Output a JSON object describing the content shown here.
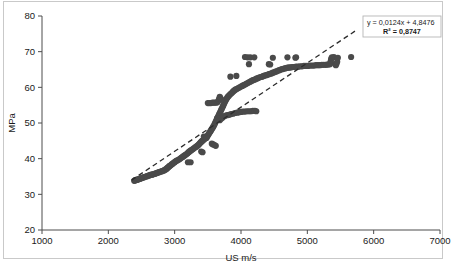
{
  "figure": {
    "background": "#ffffff",
    "border_color": "#c9c9c9"
  },
  "chart_data": {
    "type": "scatter",
    "title": "",
    "xlabel": "US m/s",
    "ylabel": "MPa",
    "xlim": [
      1000,
      7000
    ],
    "ylim": [
      20,
      80
    ],
    "xticks": [
      1000,
      2000,
      3000,
      4000,
      5000,
      6000,
      7000
    ],
    "yticks": [
      20,
      30,
      40,
      50,
      60,
      70,
      80
    ],
    "xtick_labels": [
      "1000",
      "2000",
      "3000",
      "4000",
      "5000",
      "6000",
      "7000"
    ],
    "ytick_labels": [
      "20",
      "30",
      "40",
      "50",
      "60",
      "70",
      "80"
    ],
    "grid": false,
    "legend": false,
    "marker_color": "#4a4a4a",
    "marker_size": 3.1,
    "trendline": {
      "type": "linear",
      "style": "dashed",
      "color": "#2b2b2b",
      "slope": 0.0124,
      "intercept": 4.8476,
      "equation_label": "y = 0,0124x + 4,8476",
      "r2_label": "R² = 0,8747",
      "r2_value": 0.8747,
      "x_start": 2350,
      "x_end": 5750
    },
    "points": [
      [
        2390,
        33.8
      ],
      [
        2400,
        33.9
      ],
      [
        2410,
        34.0
      ],
      [
        2420,
        34.0
      ],
      [
        2430,
        34.1
      ],
      [
        2440,
        34.1
      ],
      [
        2455,
        34.2
      ],
      [
        2465,
        34.3
      ],
      [
        2480,
        34.4
      ],
      [
        2495,
        34.5
      ],
      [
        2510,
        34.6
      ],
      [
        2525,
        34.7
      ],
      [
        2540,
        34.8
      ],
      [
        2555,
        34.9
      ],
      [
        2570,
        35.0
      ],
      [
        2585,
        35.1
      ],
      [
        2600,
        35.2
      ],
      [
        2615,
        35.3
      ],
      [
        2630,
        35.4
      ],
      [
        2645,
        35.5
      ],
      [
        2660,
        35.5
      ],
      [
        2675,
        35.6
      ],
      [
        2690,
        35.7
      ],
      [
        2705,
        35.8
      ],
      [
        2720,
        35.9
      ],
      [
        2735,
        36.0
      ],
      [
        2750,
        36.1
      ],
      [
        2765,
        36.2
      ],
      [
        2780,
        36.3
      ],
      [
        2795,
        36.4
      ],
      [
        2810,
        36.5
      ],
      [
        2825,
        36.6
      ],
      [
        2840,
        36.7
      ],
      [
        2855,
        36.9
      ],
      [
        2870,
        37.0
      ],
      [
        2880,
        37.2
      ],
      [
        2890,
        37.4
      ],
      [
        2900,
        37.5
      ],
      [
        2910,
        37.7
      ],
      [
        2920,
        37.9
      ],
      [
        2930,
        38.0
      ],
      [
        2945,
        38.2
      ],
      [
        2955,
        38.4
      ],
      [
        2965,
        38.5
      ],
      [
        2975,
        38.7
      ],
      [
        2990,
        38.9
      ],
      [
        3000,
        39.0
      ],
      [
        3010,
        39.2
      ],
      [
        3025,
        39.4
      ],
      [
        3040,
        39.5
      ],
      [
        3060,
        39.7
      ],
      [
        3075,
        39.9
      ],
      [
        3090,
        40.1
      ],
      [
        3105,
        40.3
      ],
      [
        3120,
        40.5
      ],
      [
        3135,
        40.7
      ],
      [
        3150,
        40.9
      ],
      [
        3165,
        41.1
      ],
      [
        3180,
        41.3
      ],
      [
        3195,
        41.5
      ],
      [
        3205,
        41.7
      ],
      [
        3215,
        41.9
      ],
      [
        3230,
        42.1
      ],
      [
        3245,
        42.3
      ],
      [
        3260,
        42.5
      ],
      [
        3275,
        42.7
      ],
      [
        3290,
        42.9
      ],
      [
        3305,
        43.1
      ],
      [
        3320,
        43.3
      ],
      [
        3335,
        43.5
      ],
      [
        3350,
        43.7
      ],
      [
        3360,
        43.9
      ],
      [
        3370,
        44.1
      ],
      [
        3380,
        44.3
      ],
      [
        3390,
        44.5
      ],
      [
        3400,
        44.7
      ],
      [
        3410,
        44.9
      ],
      [
        3420,
        45.0
      ],
      [
        3430,
        45.2
      ],
      [
        3440,
        45.4
      ],
      [
        3450,
        45.5
      ],
      [
        3460,
        45.7
      ],
      [
        3470,
        45.9
      ],
      [
        3480,
        46.1
      ],
      [
        3490,
        46.3
      ],
      [
        3500,
        46.5
      ],
      [
        3510,
        46.8
      ],
      [
        3520,
        47.1
      ],
      [
        3530,
        47.4
      ],
      [
        3540,
        47.7
      ],
      [
        3550,
        48.0
      ],
      [
        3560,
        48.3
      ],
      [
        3570,
        48.6
      ],
      [
        3580,
        48.9
      ],
      [
        3590,
        49.2
      ],
      [
        3600,
        49.6
      ],
      [
        3610,
        50.0
      ],
      [
        3620,
        50.4
      ],
      [
        3630,
        50.8
      ],
      [
        3640,
        51.2
      ],
      [
        3650,
        51.6
      ],
      [
        3660,
        52.0
      ],
      [
        3670,
        52.4
      ],
      [
        3680,
        52.8
      ],
      [
        3690,
        53.2
      ],
      [
        3700,
        53.6
      ],
      [
        3710,
        54.0
      ],
      [
        3720,
        54.4
      ],
      [
        3730,
        54.8
      ],
      [
        3740,
        55.2
      ],
      [
        3750,
        55.6
      ],
      [
        3760,
        56.0
      ],
      [
        3770,
        56.4
      ],
      [
        3780,
        56.7
      ],
      [
        3790,
        57.0
      ],
      [
        3800,
        57.3
      ],
      [
        3815,
        57.6
      ],
      [
        3830,
        57.9
      ],
      [
        3845,
        58.2
      ],
      [
        3860,
        58.4
      ],
      [
        3875,
        58.7
      ],
      [
        3890,
        59.0
      ],
      [
        3905,
        59.2
      ],
      [
        3920,
        59.4
      ],
      [
        3940,
        59.6
      ],
      [
        3960,
        59.8
      ],
      [
        3980,
        60.0
      ],
      [
        4000,
        60.2
      ],
      [
        4020,
        60.4
      ],
      [
        4040,
        60.6
      ],
      [
        4060,
        60.8
      ],
      [
        4080,
        61.0
      ],
      [
        4100,
        61.2
      ],
      [
        4120,
        61.4
      ],
      [
        4140,
        61.6
      ],
      [
        4160,
        61.8
      ],
      [
        4180,
        62.0
      ],
      [
        4200,
        62.1
      ],
      [
        4220,
        62.3
      ],
      [
        4240,
        62.5
      ],
      [
        4260,
        62.6
      ],
      [
        4280,
        62.8
      ],
      [
        4300,
        62.9
      ],
      [
        4320,
        63.0
      ],
      [
        4340,
        63.2
      ],
      [
        4360,
        63.3
      ],
      [
        4380,
        63.4
      ],
      [
        4400,
        63.5
      ],
      [
        4420,
        63.7
      ],
      [
        4440,
        63.8
      ],
      [
        4460,
        63.9
      ],
      [
        4480,
        64.1
      ],
      [
        4500,
        64.2
      ],
      [
        4520,
        64.4
      ],
      [
        4540,
        64.5
      ],
      [
        4560,
        64.7
      ],
      [
        4580,
        64.8
      ],
      [
        4600,
        65.0
      ],
      [
        4620,
        65.1
      ],
      [
        4640,
        65.2
      ],
      [
        4660,
        65.3
      ],
      [
        4680,
        65.4
      ],
      [
        4700,
        65.5
      ],
      [
        4720,
        65.5
      ],
      [
        4740,
        65.6
      ],
      [
        4760,
        65.6
      ],
      [
        4780,
        65.7
      ],
      [
        4800,
        65.7
      ],
      [
        4830,
        65.8
      ],
      [
        4860,
        65.8
      ],
      [
        4890,
        65.9
      ],
      [
        4920,
        65.9
      ],
      [
        4950,
        66.0
      ],
      [
        4980,
        66.0
      ],
      [
        5010,
        66.0
      ],
      [
        5040,
        66.1
      ],
      [
        5070,
        66.1
      ],
      [
        5100,
        66.1
      ],
      [
        5130,
        66.2
      ],
      [
        5160,
        66.2
      ],
      [
        5190,
        66.2
      ],
      [
        5220,
        66.3
      ],
      [
        5250,
        66.3
      ],
      [
        5280,
        66.3
      ],
      [
        5300,
        66.4
      ],
      [
        5320,
        66.4
      ],
      [
        5340,
        66.5
      ],
      [
        5350,
        67.0
      ],
      [
        5355,
        67.5
      ],
      [
        5360,
        68.0
      ],
      [
        5370,
        68.4
      ],
      [
        5400,
        68.5
      ],
      [
        5420,
        66.5
      ],
      [
        5430,
        66.2
      ],
      [
        5440,
        66.6
      ],
      [
        5450,
        67.2
      ],
      [
        5460,
        68.3
      ],
      [
        5660,
        68.5
      ],
      [
        3500,
        55.6
      ],
      [
        3520,
        55.6
      ],
      [
        3545,
        55.6
      ],
      [
        3570,
        55.7
      ],
      [
        3595,
        55.7
      ],
      [
        3620,
        55.7
      ],
      [
        3645,
        55.8
      ],
      [
        3660,
        56.3
      ],
      [
        3670,
        56.8
      ],
      [
        3680,
        57.3
      ],
      [
        3690,
        57.0
      ],
      [
        3700,
        56.6
      ],
      [
        3640,
        51.3
      ],
      [
        3660,
        51.0
      ],
      [
        3680,
        50.8
      ],
      [
        3700,
        51.2
      ],
      [
        3720,
        51.5
      ],
      [
        3740,
        51.8
      ],
      [
        3760,
        52.0
      ],
      [
        3790,
        52.2
      ],
      [
        3820,
        52.3
      ],
      [
        3850,
        52.5
      ],
      [
        3880,
        52.6
      ],
      [
        3910,
        52.8
      ],
      [
        3940,
        52.9
      ],
      [
        3970,
        53.0
      ],
      [
        4000,
        53.1
      ],
      [
        4030,
        53.2
      ],
      [
        4060,
        53.2
      ],
      [
        4090,
        53.3
      ],
      [
        4120,
        53.3
      ],
      [
        4150,
        53.3
      ],
      [
        4180,
        53.4
      ],
      [
        4210,
        53.4
      ],
      [
        4230,
        53.3
      ],
      [
        3400,
        42.0
      ],
      [
        3420,
        41.8
      ],
      [
        3200,
        39.0
      ],
      [
        3240,
        39.0
      ],
      [
        3560,
        44.2
      ],
      [
        3580,
        44.0
      ],
      [
        3600,
        43.8
      ],
      [
        3620,
        43.6
      ],
      [
        3840,
        63.0
      ],
      [
        3930,
        63.2
      ],
      [
        4060,
        68.5
      ],
      [
        4100,
        68.4
      ],
      [
        4120,
        66.5
      ],
      [
        4140,
        68.4
      ],
      [
        4200,
        68.4
      ],
      [
        4480,
        68.3
      ],
      [
        4420,
        66.5
      ],
      [
        4440,
        66.4
      ],
      [
        4700,
        68.4
      ],
      [
        4820,
        68.3
      ],
      [
        4830,
        68.4
      ],
      [
        3440,
        46.2
      ],
      [
        3460,
        46.0
      ],
      [
        3480,
        45.8
      ]
    ]
  }
}
